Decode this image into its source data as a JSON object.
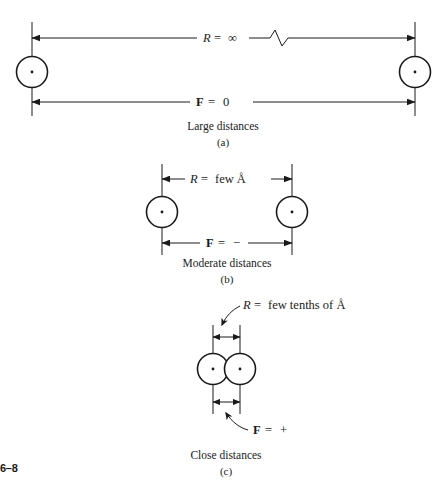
{
  "figure": {
    "number_label": "6–8",
    "panels": [
      {
        "id": "a",
        "distance_label_var": "R",
        "distance_label_eq": "=",
        "distance_label_val": "∞",
        "force_label_var": "F",
        "force_label_eq": "=",
        "force_label_val": "0",
        "caption": "Large distances",
        "caption_letter": "(a)",
        "atom_count": 2,
        "has_break_symbol": true
      },
      {
        "id": "b",
        "distance_label_var": "R",
        "distance_label_eq": "=",
        "distance_label_val": "few Å",
        "force_label_var": "F",
        "force_label_eq": "=",
        "force_label_val": "−",
        "caption": "Moderate distances",
        "caption_letter": "(b)",
        "atom_count": 2,
        "has_break_symbol": false
      },
      {
        "id": "c",
        "distance_label_var": "R",
        "distance_label_eq": "=",
        "distance_label_val": "few tenths of Å",
        "force_label_var": "F",
        "force_label_eq": "=",
        "force_label_val": "+",
        "caption": "Close distances",
        "caption_letter": "(c)",
        "atom_count": 2,
        "has_break_symbol": false
      }
    ],
    "colors": {
      "ink": "#1a1a1a",
      "background": "#ffffff"
    }
  }
}
